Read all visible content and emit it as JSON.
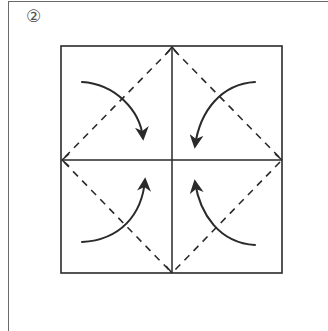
{
  "diagram": {
    "type": "origami-fold-diagram",
    "step_label": "②",
    "colors": {
      "line": "#2a2a2a",
      "frame": "#6a6a6a",
      "label": "#555555",
      "background": "#ffffff"
    },
    "square": {
      "x1": 61,
      "y1": 46,
      "x2": 282,
      "y2": 273,
      "center_x": 172,
      "center_y": 160
    },
    "creases": [
      {
        "type": "solid",
        "from": "top-mid",
        "to": "bottom-mid"
      },
      {
        "type": "solid",
        "from": "left-mid",
        "to": "right-mid"
      }
    ],
    "valley_folds": [
      {
        "from": "top-mid",
        "to": "left-mid",
        "quadrant": "top-left"
      },
      {
        "from": "top-mid",
        "to": "right-mid",
        "quadrant": "top-right"
      },
      {
        "from": "left-mid",
        "to": "bottom-mid",
        "quadrant": "bottom-left"
      },
      {
        "from": "right-mid",
        "to": "bottom-mid",
        "quadrant": "bottom-right"
      }
    ],
    "fold_arrows": [
      {
        "quadrant": "top-left",
        "direction": "toward-center"
      },
      {
        "quadrant": "top-right",
        "direction": "toward-center"
      },
      {
        "quadrant": "bottom-left",
        "direction": "toward-center"
      },
      {
        "quadrant": "bottom-right",
        "direction": "toward-center"
      }
    ]
  }
}
